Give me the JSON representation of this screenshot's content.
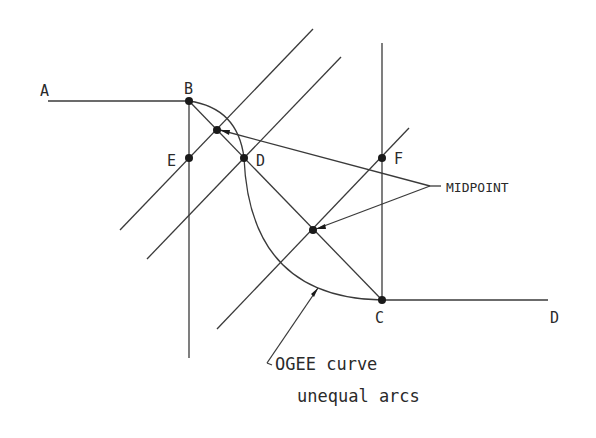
{
  "diagram": {
    "point_labels": {
      "A": "A",
      "B": "B",
      "C": "C",
      "D_curve": "D",
      "D_end": "D",
      "E": "E",
      "F": "F"
    },
    "annotations": {
      "midpoint": "MIDPOINT",
      "ogee_line1": "OGEE curve",
      "ogee_line2": "unequal arcs"
    },
    "colors": {
      "line": "#3a3a3a",
      "point": "#1a1a1a",
      "background": "#ffffff"
    }
  }
}
